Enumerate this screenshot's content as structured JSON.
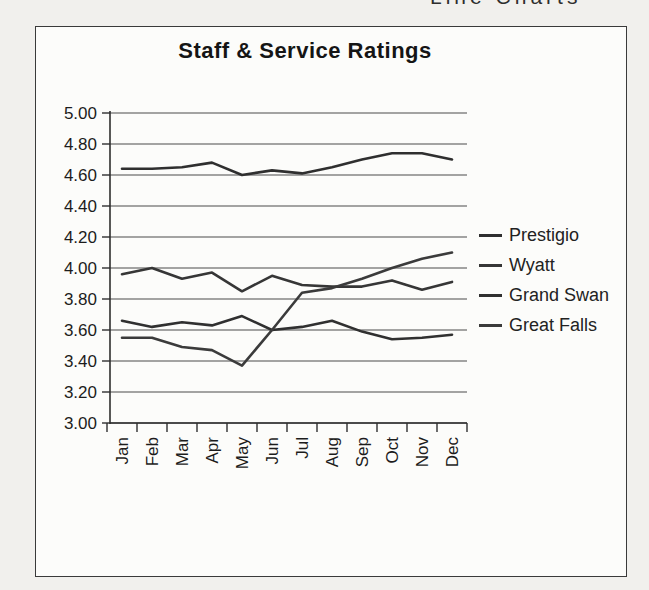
{
  "header_fragment": "Line Charts",
  "page_background": "#f1f0ed",
  "figure": {
    "background": "#fcfcfa",
    "border_color": "#3a3a3a"
  },
  "chart_data": {
    "type": "line",
    "title": "Staff & Service Ratings",
    "xlabel": "",
    "ylabel": "",
    "categories": [
      "Jan",
      "Feb",
      "Mar",
      "Apr",
      "May",
      "Jun",
      "Jul",
      "Aug",
      "Sep",
      "Oct",
      "Nov",
      "Dec"
    ],
    "series": [
      {
        "name": "Prestigio",
        "color": "#2f2f2f",
        "values": [
          4.64,
          4.64,
          4.65,
          4.68,
          4.6,
          4.63,
          4.61,
          4.65,
          4.7,
          4.74,
          4.74,
          4.7
        ]
      },
      {
        "name": "Wyatt",
        "color": "#363636",
        "values": [
          3.96,
          4.0,
          3.93,
          3.97,
          3.85,
          3.95,
          3.89,
          3.88,
          3.88,
          3.92,
          3.86,
          3.91
        ]
      },
      {
        "name": "Grand Swan",
        "color": "#303030",
        "values": [
          3.66,
          3.62,
          3.65,
          3.63,
          3.69,
          3.6,
          3.62,
          3.66,
          3.59,
          3.54,
          3.55,
          3.57
        ]
      },
      {
        "name": "Great Falls",
        "color": "#3b3b3b",
        "values": [
          3.55,
          3.55,
          3.49,
          3.47,
          3.37,
          3.6,
          3.84,
          3.87,
          3.93,
          4.0,
          4.06,
          4.1
        ]
      }
    ],
    "ylim": [
      3.0,
      5.0
    ],
    "ytick_step": 0.2,
    "ytick_labels": [
      "5.00",
      "4.80",
      "4.60",
      "4.40",
      "4.20",
      "4.00",
      "3.80",
      "3.60",
      "3.40",
      "3.20",
      "3.00"
    ],
    "grid": "horizontal",
    "gridline_color": "#4a4a4a",
    "axis_color": "#2e2e2e",
    "legend_position": "right"
  }
}
